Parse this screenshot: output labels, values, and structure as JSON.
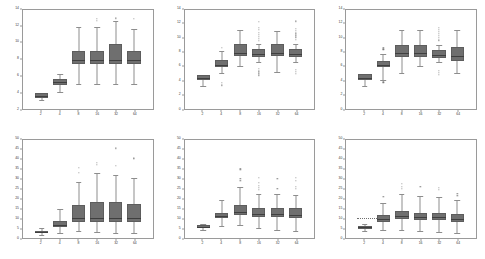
{
  "figure": {
    "rows": 2,
    "cols": 3,
    "background": "#ffffff",
    "box_fill": "#6f6f6f",
    "box_edge": "#5d5d5d",
    "median_color": "#3f3f3f",
    "whisker_color": "#8d8d8d",
    "outlier_color": "#7d7d7d",
    "axis_color": "#9a9a9a"
  },
  "chart_data": [
    {
      "type": "box",
      "panel_index": 0,
      "panel_position": "top-left",
      "title": "",
      "xlabel": "",
      "ylabel": "",
      "xlim": [
        0,
        7
      ],
      "ylim": [
        2,
        14
      ],
      "yticks": [
        2,
        4,
        6,
        8,
        10,
        12,
        14
      ],
      "ytick_labels": [
        "2",
        "4",
        "6",
        "8",
        "10",
        "12",
        "14"
      ],
      "categories": [
        "2",
        "4",
        "8",
        "16",
        "32",
        "64"
      ],
      "grid": false,
      "legend": null,
      "boxes": [
        {
          "category": "2",
          "whisker_low": 3.0,
          "q1": 3.3,
          "median": 3.5,
          "q3": 3.9,
          "whisker_high": 3.9,
          "outliers": []
        },
        {
          "category": "4",
          "whisker_low": 4.0,
          "q1": 4.9,
          "median": 5.2,
          "q3": 5.6,
          "whisker_high": 6.2,
          "outliers": []
        },
        {
          "category": "8",
          "whisker_low": 5.0,
          "q1": 7.4,
          "median": 7.9,
          "q3": 9.0,
          "whisker_high": 11.9,
          "outliers": []
        },
        {
          "category": "16",
          "whisker_low": 5.0,
          "q1": 7.4,
          "median": 7.9,
          "q3": 9.0,
          "whisker_high": 11.9,
          "outliers": [
            12.7,
            12.9
          ]
        },
        {
          "category": "32",
          "whisker_low": 5.0,
          "q1": 7.4,
          "median": 7.9,
          "q3": 9.9,
          "whisker_high": 12.6,
          "outliers": [
            13.0
          ]
        },
        {
          "category": "64",
          "whisker_low": 5.0,
          "q1": 7.4,
          "median": 7.9,
          "q3": 9.0,
          "whisker_high": 11.7,
          "outliers": [
            12.9
          ]
        }
      ]
    },
    {
      "type": "box",
      "panel_index": 1,
      "panel_position": "top-center",
      "title": "",
      "xlabel": "",
      "ylabel": "",
      "xlim": [
        0,
        7
      ],
      "ylim": [
        0,
        14
      ],
      "yticks": [
        0,
        2,
        4,
        6,
        8,
        10,
        12,
        14
      ],
      "ytick_labels": [
        "0",
        "2",
        "4",
        "6",
        "8",
        "10",
        "12",
        "14"
      ],
      "categories": [
        "2",
        "4",
        "8",
        "16",
        "32",
        "64"
      ],
      "grid": false,
      "legend": null,
      "boxes": [
        {
          "category": "2",
          "whisker_low": 3.2,
          "q1": 4.1,
          "median": 4.4,
          "q3": 4.8,
          "whisker_high": 4.8,
          "outliers": []
        },
        {
          "category": "4",
          "whisker_low": 5.0,
          "q1": 5.9,
          "median": 6.2,
          "q3": 6.9,
          "whisker_high": 8.2,
          "outliers": [
            8.6,
            3.6,
            3.3
          ]
        },
        {
          "category": "8",
          "whisker_low": 6.0,
          "q1": 7.4,
          "median": 7.9,
          "q3": 9.2,
          "whisker_high": 11.1,
          "outliers": []
        },
        {
          "category": "16",
          "whisker_low": 6.6,
          "q1": 7.3,
          "median": 7.7,
          "q3": 8.5,
          "whisker_high": 9.2,
          "outliers": [
            12.3,
            11.5,
            11.2,
            10.8,
            10.5,
            10.2,
            9.9,
            9.6,
            5.6,
            5.3,
            5.0,
            4.7
          ]
        },
        {
          "category": "32",
          "whisker_low": 5.2,
          "q1": 7.4,
          "median": 7.9,
          "q3": 9.2,
          "whisker_high": 11.0,
          "outliers": []
        },
        {
          "category": "64",
          "whisker_low": 6.6,
          "q1": 7.3,
          "median": 7.7,
          "q3": 8.5,
          "whisker_high": 9.2,
          "outliers": [
            12.4,
            11.3,
            11.0,
            10.7,
            10.4,
            10.1,
            9.8,
            5.5,
            5.2,
            4.9
          ]
        }
      ]
    },
    {
      "type": "box",
      "panel_index": 2,
      "panel_position": "top-right",
      "title": "",
      "xlabel": "",
      "ylabel": "",
      "xlim": [
        0,
        7
      ],
      "ylim": [
        0,
        14
      ],
      "yticks": [
        0,
        2,
        4,
        6,
        8,
        10,
        12,
        14
      ],
      "ytick_labels": [
        "0",
        "2",
        "4",
        "6",
        "8",
        "10",
        "12",
        "14"
      ],
      "categories": [
        "2",
        "4",
        "8",
        "16",
        "32",
        "64"
      ],
      "grid": false,
      "legend": null,
      "boxes": [
        {
          "category": "2",
          "whisker_low": 3.2,
          "q1": 4.1,
          "median": 4.4,
          "q3": 4.9,
          "whisker_high": 4.9,
          "outliers": []
        },
        {
          "category": "4",
          "whisker_low": 4.1,
          "q1": 5.9,
          "median": 6.2,
          "q3": 6.7,
          "whisker_high": 7.7,
          "outliers": [
            8.6,
            8.4,
            3.7
          ]
        },
        {
          "category": "8",
          "whisker_low": 5.1,
          "q1": 7.3,
          "median": 7.9,
          "q3": 9.0,
          "whisker_high": 11.2,
          "outliers": []
        },
        {
          "category": "16",
          "whisker_low": 6.0,
          "q1": 7.3,
          "median": 7.9,
          "q3": 9.0,
          "whisker_high": 11.2,
          "outliers": []
        },
        {
          "category": "32",
          "whisker_low": 6.6,
          "q1": 7.2,
          "median": 7.6,
          "q3": 8.3,
          "whisker_high": 9.0,
          "outliers": [
            11.5,
            11.2,
            10.9,
            10.6,
            10.3,
            10.0,
            9.7,
            5.4,
            5.1,
            4.8
          ]
        },
        {
          "category": "64",
          "whisker_low": 5.0,
          "q1": 6.8,
          "median": 7.5,
          "q3": 8.8,
          "whisker_high": 11.1,
          "outliers": []
        }
      ]
    },
    {
      "type": "box",
      "panel_index": 3,
      "panel_position": "bottom-left",
      "title": "",
      "xlabel": "",
      "ylabel": "",
      "xlim": [
        0,
        7
      ],
      "ylim": [
        0,
        50
      ],
      "yticks": [
        0,
        5,
        10,
        15,
        20,
        25,
        30,
        35,
        40,
        45,
        50
      ],
      "ytick_labels": [
        "0",
        "5",
        "10",
        "15",
        "20",
        "25",
        "30",
        "35",
        "40",
        "45",
        "50"
      ],
      "categories": [
        "2",
        "4",
        "8",
        "16",
        "32",
        "64"
      ],
      "grid": false,
      "legend": null,
      "boxes": [
        {
          "category": "2",
          "whisker_low": 1.5,
          "q1": 2.3,
          "median": 2.8,
          "q3": 3.6,
          "whisker_high": 5.2,
          "outliers": []
        },
        {
          "category": "4",
          "whisker_low": 2.5,
          "q1": 5.6,
          "median": 6.6,
          "q3": 8.5,
          "whisker_high": 14.5,
          "outliers": []
        },
        {
          "category": "8",
          "whisker_low": 3.5,
          "q1": 8.0,
          "median": 10.2,
          "q3": 16.5,
          "whisker_high": 28.5,
          "outliers": [
            33.0,
            35.5
          ]
        },
        {
          "category": "16",
          "whisker_low": 3.0,
          "q1": 8.0,
          "median": 10.4,
          "q3": 18.5,
          "whisker_high": 33.0,
          "outliers": [
            37.0,
            38.0
          ]
        },
        {
          "category": "32",
          "whisker_low": 2.5,
          "q1": 8.0,
          "median": 10.4,
          "q3": 18.5,
          "whisker_high": 32.0,
          "outliers": [
            36.5,
            45.5
          ]
        },
        {
          "category": "64",
          "whisker_low": 2.5,
          "q1": 8.0,
          "median": 10.2,
          "q3": 17.5,
          "whisker_high": 30.5,
          "outliers": [
            40.0,
            40.5
          ]
        }
      ]
    },
    {
      "type": "box",
      "panel_index": 4,
      "panel_position": "bottom-center",
      "title": "",
      "xlabel": "",
      "ylabel": "",
      "xlim": [
        0,
        7
      ],
      "ylim": [
        0,
        50
      ],
      "yticks": [
        0,
        5,
        10,
        15,
        20,
        25,
        30,
        35,
        40,
        45,
        50
      ],
      "ytick_labels": [
        "0",
        "5",
        "10",
        "15",
        "20",
        "25",
        "30",
        "35",
        "40",
        "45",
        "50"
      ],
      "categories": [
        "2",
        "4",
        "8",
        "16",
        "32",
        "64"
      ],
      "grid": false,
      "legend": null,
      "boxes": [
        {
          "category": "2",
          "whisker_low": 4.2,
          "q1": 5.2,
          "median": 5.8,
          "q3": 6.5,
          "whisker_high": 7.2,
          "outliers": []
        },
        {
          "category": "4",
          "whisker_low": 6.0,
          "q1": 10.0,
          "median": 11.2,
          "q3": 12.8,
          "whisker_high": 19.5,
          "outliers": []
        },
        {
          "category": "8",
          "whisker_low": 6.5,
          "q1": 11.5,
          "median": 13.0,
          "q3": 16.5,
          "whisker_high": 26.0,
          "outliers": [
            29.0,
            30.0,
            34.5,
            35.0
          ]
        },
        {
          "category": "16",
          "whisker_low": 5.0,
          "q1": 10.5,
          "median": 12.2,
          "q3": 15.0,
          "whisker_high": 22.5,
          "outliers": [
            24.5,
            25.5,
            26.5,
            28.0,
            30.5
          ]
        },
        {
          "category": "32",
          "whisker_low": 4.0,
          "q1": 10.5,
          "median": 12.2,
          "q3": 15.2,
          "whisker_high": 22.5,
          "outliers": [
            25.0,
            30.0
          ]
        },
        {
          "category": "64",
          "whisker_low": 3.5,
          "q1": 10.2,
          "median": 11.8,
          "q3": 15.0,
          "whisker_high": 22.0,
          "outliers": [
            25.0,
            26.0,
            29.0,
            30.5
          ]
        }
      ]
    },
    {
      "type": "box",
      "panel_index": 5,
      "panel_position": "bottom-right",
      "title": "",
      "xlabel": "",
      "ylabel": "",
      "xlim": [
        0,
        7
      ],
      "ylim": [
        0,
        50
      ],
      "yticks": [
        0,
        5,
        10,
        15,
        20,
        25,
        30,
        35,
        40,
        45,
        50
      ],
      "ytick_labels": [
        "0",
        "5",
        "10",
        "15",
        "20",
        "25",
        "30",
        "35",
        "40",
        "45",
        "50"
      ],
      "categories": [
        "2",
        "4",
        "8",
        "16",
        "32",
        "64"
      ],
      "grid": false,
      "legend": null,
      "reference_line": {
        "y": 10.0,
        "style": "dotted",
        "x_start": 0.55,
        "x_end": 2.0
      },
      "boxes": [
        {
          "category": "2",
          "whisker_low": 3.5,
          "q1": 4.8,
          "median": 5.4,
          "q3": 6.2,
          "whisker_high": 7.0,
          "outliers": []
        },
        {
          "category": "4",
          "whisker_low": 4.0,
          "q1": 8.0,
          "median": 9.6,
          "q3": 11.5,
          "whisker_high": 18.0,
          "outliers": [
            21.0
          ]
        },
        {
          "category": "8",
          "whisker_low": 4.0,
          "q1": 9.5,
          "median": 11.0,
          "q3": 13.5,
          "whisker_high": 22.5,
          "outliers": [
            25.0,
            26.0,
            27.5
          ]
        },
        {
          "category": "16",
          "whisker_low": 3.5,
          "q1": 9.0,
          "median": 10.5,
          "q3": 12.8,
          "whisker_high": 21.5,
          "outliers": [
            26.0
          ]
        },
        {
          "category": "32",
          "whisker_low": 3.0,
          "q1": 9.0,
          "median": 10.5,
          "q3": 12.8,
          "whisker_high": 21.0,
          "outliers": [
            24.5,
            25.5
          ]
        },
        {
          "category": "64",
          "whisker_low": 2.5,
          "q1": 8.2,
          "median": 9.8,
          "q3": 12.0,
          "whisker_high": 19.5,
          "outliers": [
            21.5,
            22.5
          ]
        }
      ]
    }
  ]
}
